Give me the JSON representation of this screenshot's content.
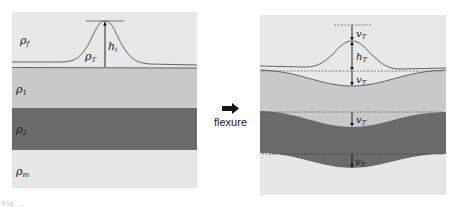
{
  "colors": {
    "fluid": "#e8e8e8",
    "layer1": "#c9c9c9",
    "layer2": "#6b6b6b",
    "mantle": "#e6e6e6",
    "line": "#555555",
    "arrow": "#111111"
  },
  "left_panel": {
    "labels": {
      "fluid": "ρ",
      "fluid_sub": "f",
      "layer1": "ρ",
      "layer1_sub": "1",
      "layer2": "ρ",
      "layer2_sub": "2",
      "mantle": "ρ",
      "mantle_sub": "m",
      "topo_density": "ρ",
      "topo_density_sub": "T",
      "height": "h",
      "height_sub": "i"
    }
  },
  "transition": {
    "label": "flexure",
    "arrow": "right-arrow-icon"
  },
  "right_panel": {
    "labels": {
      "deflection_top": "v",
      "deflection_top_sub": "T",
      "height": "h",
      "height_sub": "T",
      "deflection_1": "v",
      "deflection_1_sub": "T",
      "deflection_2": "v",
      "deflection_2_sub": "T",
      "deflection_3": "v",
      "deflection_3_sub": "T"
    }
  },
  "caption": "Fig. ..."
}
